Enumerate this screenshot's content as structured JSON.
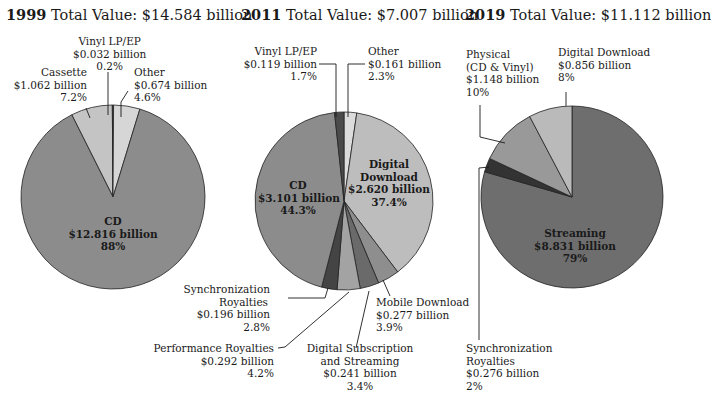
{
  "chart_data": [
    {
      "type": "pie",
      "year": "1999",
      "title_year": "1999",
      "title_rest": "Total Value: $14.584 billion",
      "total": "$14.584 billion",
      "slices": [
        {
          "name": "CD",
          "value_label": "$12.816 billion",
          "value": 12.816,
          "pct_label": "88%",
          "pct": 88,
          "color": "#8c8c8c"
        },
        {
          "name": "Cassette",
          "value_label": "$1.062 billion",
          "value": 1.062,
          "pct_label": "7.2%",
          "pct": 7.2,
          "color": "#c4c4c4"
        },
        {
          "name": "Vinyl LP/EP",
          "value_label": "$0.032 billion",
          "value": 0.032,
          "pct_label": "0.2%",
          "pct": 0.2,
          "color": "#3a3a3a"
        },
        {
          "name": "Other",
          "value_label": "$0.674 billion",
          "value": 0.674,
          "pct_label": "4.6%",
          "pct": 4.6,
          "color": "#d6d6d6"
        }
      ]
    },
    {
      "type": "pie",
      "year": "2011",
      "title_year": "2011",
      "title_rest": "Total Value: $7.007 billion",
      "total": "$7.007 billion",
      "slices": [
        {
          "name": "Other",
          "value_label": "$0.161 billion",
          "value": 0.161,
          "pct_label": "2.3%",
          "pct": 2.3,
          "color": "#dcdcdc"
        },
        {
          "name": "Digital Download",
          "value_label": "$2.620 billion",
          "value": 2.62,
          "pct_label": "37.4%",
          "pct": 37.4,
          "color": "#bdbdbd"
        },
        {
          "name": "Mobile Download",
          "value_label": "$0.277 billion",
          "value": 0.277,
          "pct_label": "3.9%",
          "pct": 3.9,
          "color": "#8e8e8e"
        },
        {
          "name": "Digital Subscription and Streaming",
          "value_label": "$0.241 billion",
          "value": 0.241,
          "pct_label": "3.4%",
          "pct": 3.4,
          "color": "#6a6a6a"
        },
        {
          "name": "Performance Royalties",
          "value_label": "$0.292 billion",
          "value": 0.292,
          "pct_label": "4.2%",
          "pct": 4.2,
          "color": "#a3a3a3"
        },
        {
          "name": "Synchronization Royalties",
          "value_label": "$0.196 billion",
          "value": 0.196,
          "pct_label": "2.8%",
          "pct": 2.8,
          "color": "#444444"
        },
        {
          "name": "CD",
          "value_label": "$3.101 billion",
          "value": 3.101,
          "pct_label": "44.3%",
          "pct": 44.3,
          "color": "#8c8c8c"
        },
        {
          "name": "Vinyl LP/EP",
          "value_label": "$0.119 billion",
          "value": 0.119,
          "pct_label": "1.7%",
          "pct": 1.7,
          "color": "#4a4a4a"
        }
      ]
    },
    {
      "type": "pie",
      "year": "2019",
      "title_year": "2019",
      "title_rest": "Total Value: $11.112 billion",
      "total": "$11.112 billion",
      "slices": [
        {
          "name": "Streaming",
          "value_label": "$8.831 billion",
          "value": 8.831,
          "pct_label": "79%",
          "pct": 79,
          "color": "#6e6e6e"
        },
        {
          "name": "Synchronization Royalties",
          "value_label": "$0.276 billion",
          "value": 0.276,
          "pct_label": "2%",
          "pct": 2,
          "color": "#333333"
        },
        {
          "name": "Physical (CD & Vinyl)",
          "value_label": "$1.148 billion",
          "value": 1.148,
          "pct_label": "10%",
          "pct": 10,
          "color": "#999999"
        },
        {
          "name": "Digital Download",
          "value_label": "$0.856 billion",
          "value": 0.856,
          "pct_label": "8%",
          "pct": 8,
          "color": "#bababa"
        }
      ]
    }
  ],
  "labels": {
    "p1": {
      "vinyl": [
        "Vinyl LP/EP",
        "$0.032 billion",
        "0.2%"
      ],
      "cassette": [
        "Cassette",
        "$1.062 billion",
        "7.2%"
      ],
      "other": [
        "Other",
        "$0.674 billion",
        "4.6%"
      ],
      "cd": [
        "CD",
        "$12.816 billion",
        "88%"
      ]
    },
    "p2": {
      "vinyl": [
        "Vinyl LP/EP",
        "$0.119 billion",
        "1.7%"
      ],
      "other": [
        "Other",
        "$0.161 billion",
        "2.3%"
      ],
      "cd": [
        "CD",
        "$3.101 billion",
        "44.3%"
      ],
      "download": [
        "Digital",
        "Download",
        "$2.620 billion",
        "37.4%"
      ],
      "sync": [
        "Synchronization",
        "Royalties",
        "$0.196 billion",
        "2.8%"
      ],
      "perf": [
        "Performance Royalties",
        "$0.292 billion",
        "4.2%"
      ],
      "stream": [
        "Digital Subscription",
        "and Streaming",
        "$0.241 billion",
        "3.4%"
      ],
      "mobile": [
        "Mobile Download",
        "$0.277 billion",
        "3.9%"
      ]
    },
    "p3": {
      "physical": [
        "Physical",
        "(CD & Vinyl)",
        "$1.148 billion",
        "10%"
      ],
      "download": [
        "Digital Download",
        "$0.856 billion",
        "8%"
      ],
      "stream": [
        "Streaming",
        "$8.831 billion",
        "79%"
      ],
      "sync": [
        "Synchronization",
        "Royalties",
        "$0.276 billion",
        "2%"
      ]
    }
  }
}
